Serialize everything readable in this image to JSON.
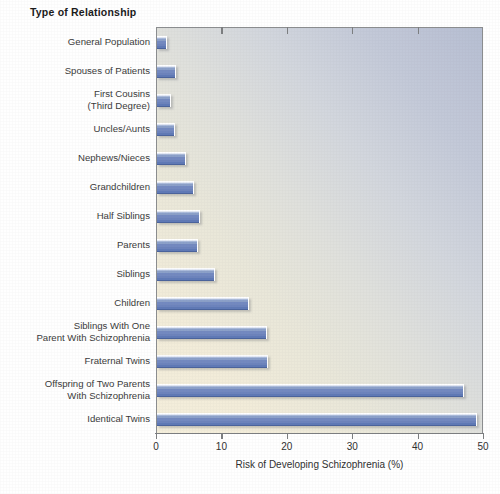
{
  "chart_data": {
    "type": "bar",
    "orientation": "horizontal",
    "title": "Type of Relationship",
    "xlabel": "Risk of Developing Schizophrenia (%)",
    "ylabel": "Type of Relationship",
    "xlim": [
      0,
      50
    ],
    "xticks": [
      0,
      10,
      20,
      30,
      40,
      50
    ],
    "xtick_labels": [
      "0",
      "10",
      "20",
      "30",
      "40",
      "50"
    ],
    "grid": false,
    "legend": "none",
    "categories": [
      "General Population",
      "Spouses of Patients",
      "First Cousins\n(Third Degree)",
      "Uncles/Aunts",
      "Nephews/Nieces",
      "Grandchildren",
      "Half Siblings",
      "Parents",
      "Siblings",
      "Children",
      "Siblings With One\nParent With Schizophrenia",
      "Fraternal Twins",
      "Offspring of Two Parents\nWith Schizophrenia",
      "Identical Twins"
    ],
    "values": [
      1.4,
      2.7,
      2.0,
      2.6,
      4.3,
      5.5,
      6.4,
      6.1,
      8.7,
      13.9,
      16.7,
      16.8,
      46.8,
      48.8
    ],
    "bar_color": "#6c83bc",
    "bar_highlight_color": "#aabada",
    "bar_shadow_color": "#4a639c",
    "plot_bg_from": "#f4eedb",
    "plot_bg_to": "#b6bed2",
    "axis_color": "#7c7e80",
    "text_color": "#333333"
  }
}
